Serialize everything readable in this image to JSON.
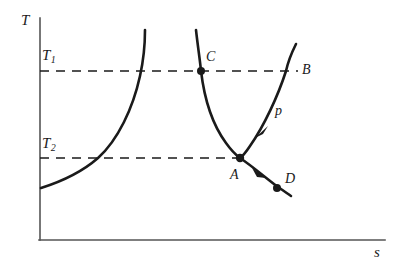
{
  "figure": {
    "type": "thermodynamic-Ts-diagram",
    "background_color": "#ffffff",
    "ink_color": "#1a1a1a",
    "axis_color": "#555555"
  },
  "axes": {
    "y_label": "T",
    "x_label": "s",
    "y_axis_x_px": 40,
    "y_axis_top_px": 18,
    "y_axis_bottom_px": 240,
    "x_axis_y_px": 240,
    "x_axis_left_px": 40,
    "x_axis_right_px": 385
  },
  "isotherms": [
    {
      "name": "T1",
      "label": "T",
      "subscript": "1",
      "y_px": 71,
      "style": "dashed",
      "x_start_px": 40,
      "x_end_px": 298
    },
    {
      "name": "T2",
      "label": "T",
      "subscript": "2",
      "y_px": 158,
      "style": "dashed",
      "x_start_px": 40,
      "x_end_px": 240
    }
  ],
  "curves": [
    {
      "name": "left-saturation-curve",
      "path": "M 41,188 C 60,182 82,172 98,158 C 118,140 133,108 140,76 C 144,58 145,42 145,30"
    },
    {
      "name": "middle-curve-C-to-A",
      "path": "M 196,30 C 198,48 200,60 201,71 C 204,96 212,124 226,143 C 231,150 236,155 240,158"
    },
    {
      "name": "right-curve-B-to-A",
      "path": "M 296,44 C 292,52 288,62 286,71 C 278,96 264,126 250,146 C 246,152 243,156 240,158"
    },
    {
      "name": "curve-A-to-D",
      "path": "M 240,158 C 252,166 266,178 278,187 C 284,191 288,194 291,196"
    }
  ],
  "points": [
    {
      "name": "C",
      "label": "C",
      "x_px": 201,
      "y_px": 71,
      "marker": "filled-dot"
    },
    {
      "name": "A",
      "label": "A",
      "x_px": 240,
      "y_px": 158,
      "marker": "filled-dot"
    },
    {
      "name": "D",
      "label": "D",
      "x_px": 277,
      "y_px": 188,
      "marker": "filled-dot"
    },
    {
      "name": "B",
      "label": "B",
      "x_px": 302,
      "y_px": 71,
      "marker": "none"
    }
  ],
  "arrows": [
    {
      "name": "arrow-on-right-curve",
      "x_px": 258,
      "y_px": 133,
      "direction": "down-left"
    },
    {
      "name": "arrow-on-AD-curve",
      "x_px": 258,
      "y_px": 173,
      "direction": "down-right"
    }
  ],
  "curve_labels": [
    {
      "name": "isobar-p",
      "label": "p",
      "x_px": 279,
      "y_px": 111
    }
  ]
}
